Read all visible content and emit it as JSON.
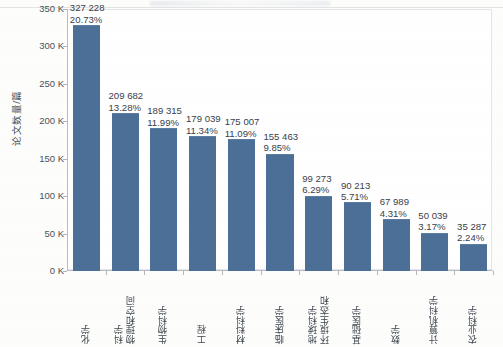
{
  "chart_data": {
    "type": "bar",
    "title": "",
    "xlabel": "",
    "ylabel": "论文数量/篇",
    "ylim": [
      0,
      350000
    ],
    "ytick_labels": [
      "0 K",
      "50 K",
      "100 K",
      "150 K",
      "200 K",
      "250 K",
      "300 K",
      "350 K"
    ],
    "ytick_values": [
      0,
      50000,
      100000,
      150000,
      200000,
      250000,
      300000,
      350000
    ],
    "grid": false,
    "legend": null,
    "bar_color": "#4b6f96",
    "categories": [
      "化学",
      "物理和空间科学",
      "生物科学",
      "工程",
      "材料科学",
      "临床医学",
      "环境生态和地球科学",
      "基础医学",
      "数学",
      "计算机科学",
      "农业科学"
    ],
    "category_lines": [
      [
        "化学"
      ],
      [
        "物理和空间",
        "科学"
      ],
      [
        "生物科学"
      ],
      [
        "工程"
      ],
      [
        "材料科学"
      ],
      [
        "临床医学"
      ],
      [
        "环境生态和",
        "地球科学"
      ],
      [
        "基础医学"
      ],
      [
        "数学"
      ],
      [
        "计算机科学"
      ],
      [
        "农业科学"
      ]
    ],
    "values": [
      327228,
      209682,
      189315,
      179039,
      175007,
      155463,
      99273,
      90213,
      67989,
      50039,
      35287
    ],
    "value_labels": [
      "327 228",
      "209 682",
      "189 315",
      "179 039",
      "175 007",
      "155 463",
      "99 273",
      "90 213",
      "67 989",
      "50 039",
      "35 287"
    ],
    "percent_labels": [
      "20.73%",
      "13.28%",
      "11.99%",
      "11.34%",
      "11.09%",
      "9.85%",
      "6.29%",
      "5.71%",
      "4.31%",
      "3.17%",
      "2.24%"
    ],
    "percents": [
      20.73,
      13.28,
      11.99,
      11.34,
      11.09,
      9.85,
      6.29,
      5.71,
      4.31,
      3.17,
      2.24
    ]
  }
}
